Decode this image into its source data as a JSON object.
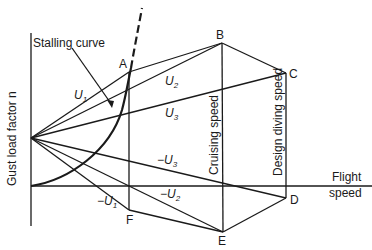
{
  "diagram": {
    "y_axis_label": "Gust load factor n",
    "x_axis_label_line1": "Flight",
    "x_axis_label_line2": "speed",
    "stalling_curve_label": "Stalling curve",
    "vertical_labels": {
      "cruising": "Cruising speed",
      "diving": "Design diving speed"
    },
    "points": {
      "A": "A",
      "B": "B",
      "C": "C",
      "D": "D",
      "E": "E",
      "F": "F"
    },
    "gust_lines": {
      "u1": "U",
      "u1_sub": "1",
      "u2": "U",
      "u2_sub": "2",
      "u3": "U",
      "u3_sub": "3",
      "mu1": "−U",
      "mu1_sub": "1",
      "mu2": "−U",
      "mu2_sub": "2",
      "mu3": "−U",
      "mu3_sub": "3"
    },
    "colors": {
      "ink": "#1a1a1a",
      "background": "#ffffff"
    }
  }
}
